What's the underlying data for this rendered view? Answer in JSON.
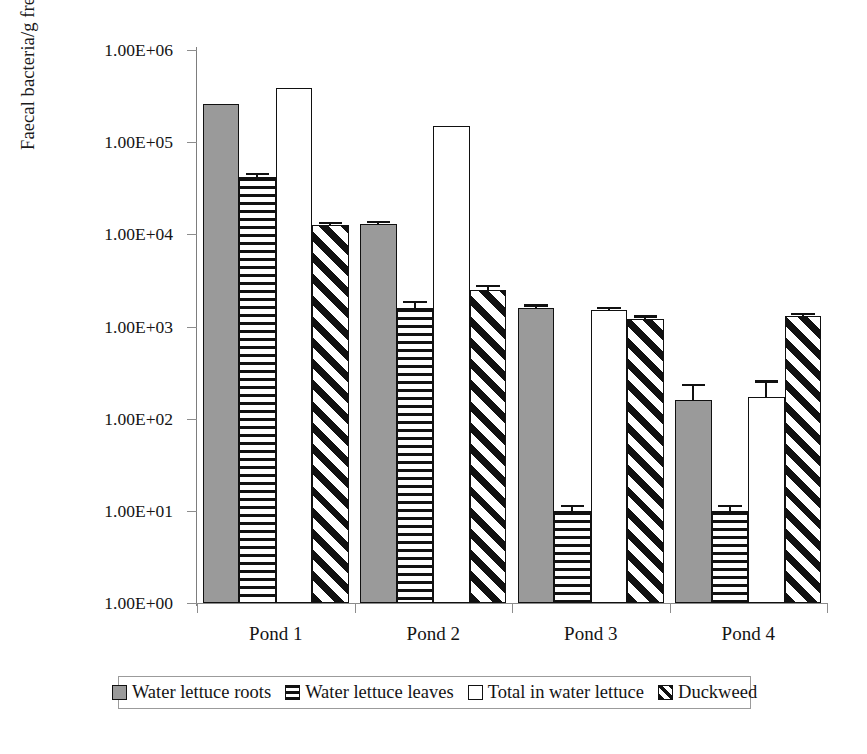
{
  "chart_data": {
    "type": "bar",
    "title": "",
    "subtitle": "",
    "xlabel": "",
    "ylabel": "Faecal bacteria/g freshweight of plant biomas",
    "categories": [
      "Pond 1",
      "Pond 2",
      "Pond 3",
      "Pond 4"
    ],
    "yscale": "log",
    "ylim": [
      1,
      1000000
    ],
    "ytick_values": [
      1000000,
      100000,
      10000,
      1000,
      100,
      10,
      1
    ],
    "ytick_labels": [
      "1.00E+06",
      "1.00E+05",
      "1.00E+04",
      "1.00E+03",
      "1.00E+02",
      "1.00E+01",
      "1.00E+00"
    ],
    "grid": false,
    "legend_position": "bottom",
    "series": [
      {
        "name": "Water lettuce roots",
        "pattern": "solid-gray",
        "values": [
          260000,
          13000,
          1600,
          160
        ],
        "errors_upper": [
          0,
          1000,
          140,
          80
        ]
      },
      {
        "name": "Water lettuce leaves",
        "pattern": "horizontal-lines",
        "values": [
          42000,
          1600,
          10,
          10
        ],
        "errors_upper": [
          4000,
          300,
          1.5,
          1.5
        ]
      },
      {
        "name": "Total in water lettuce",
        "pattern": "open-white",
        "values": [
          390000,
          150000,
          1500,
          170
        ],
        "errors_upper": [
          0,
          0,
          130,
          90
        ]
      },
      {
        "name": "Duckweed",
        "pattern": "diagonal-hatch",
        "values": [
          12500,
          2500,
          1200,
          1300
        ],
        "errors_upper": [
          1200,
          300,
          120,
          110
        ]
      }
    ]
  },
  "legend": {
    "entries": [
      {
        "label": "Water lettuce roots"
      },
      {
        "label": "Water lettuce leaves"
      },
      {
        "label": "Total in water lettuce"
      },
      {
        "label": "Duckweed"
      }
    ]
  },
  "colors": {
    "roots_fill": "#9a9a9a",
    "outline": "#111111",
    "axis": "#8a8a8a",
    "text": "#141414",
    "background": "#ffffff"
  }
}
